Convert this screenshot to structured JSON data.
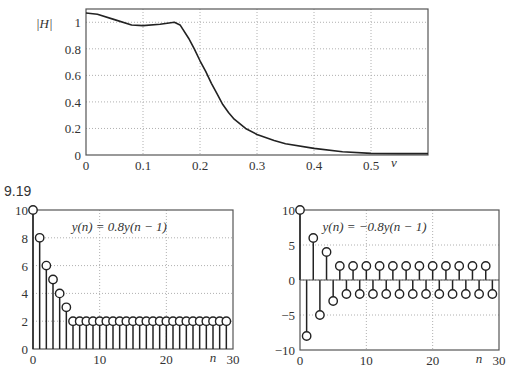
{
  "figure_label": "9.19",
  "chart_data": [
    {
      "type": "line",
      "title": "",
      "xlabel": "v",
      "ylabel": "|H|",
      "xlim": [
        0,
        0.6
      ],
      "ylim": [
        0,
        1.1
      ],
      "grid": true,
      "xticks": [
        0,
        0.1,
        0.2,
        0.3,
        0.4,
        0.5
      ],
      "xtick_labels": [
        "0",
        "0.1",
        "0.2",
        "0.3",
        "0.4",
        "0.5"
      ],
      "yticks": [
        0,
        0.2,
        0.4,
        0.6,
        0.8,
        1
      ],
      "ytick_labels": [
        "0",
        "0.2",
        "0.4",
        "0.6",
        "0.8",
        "1"
      ],
      "x": [
        0,
        0.02,
        0.05,
        0.08,
        0.1,
        0.13,
        0.155,
        0.165,
        0.18,
        0.19,
        0.2,
        0.21,
        0.22,
        0.23,
        0.24,
        0.25,
        0.26,
        0.28,
        0.3,
        0.33,
        0.35,
        0.4,
        0.45,
        0.5,
        0.55,
        0.6
      ],
      "y": [
        1.07,
        1.06,
        1.02,
        0.98,
        0.975,
        0.985,
        1.0,
        0.98,
        0.88,
        0.8,
        0.71,
        0.63,
        0.54,
        0.46,
        0.38,
        0.32,
        0.27,
        0.2,
        0.155,
        0.11,
        0.085,
        0.05,
        0.025,
        0.012,
        0.01,
        0.01
      ]
    },
    {
      "type": "stem",
      "title": "",
      "annotation": "y(n) = 0.8y(n − 1)",
      "xlabel": "n",
      "ylabel": "",
      "xlim": [
        0,
        30
      ],
      "ylim": [
        0,
        10
      ],
      "grid": true,
      "xticks": [
        0,
        10,
        20,
        30
      ],
      "xtick_labels": [
        "0",
        "10",
        "20",
        "30"
      ],
      "yticks": [
        0,
        2,
        4,
        6,
        8,
        10
      ],
      "ytick_labels": [
        "0",
        "2",
        "4",
        "6",
        "8",
        "10"
      ],
      "x": [
        0,
        1,
        2,
        3,
        4,
        5,
        6,
        7,
        8,
        9,
        10,
        11,
        12,
        13,
        14,
        15,
        16,
        17,
        18,
        19,
        20,
        21,
        22,
        23,
        24,
        25,
        26,
        27,
        28,
        29
      ],
      "y": [
        10,
        8,
        6,
        5,
        4,
        3,
        2,
        2,
        2,
        2,
        2,
        2,
        2,
        2,
        2,
        2,
        2,
        2,
        2,
        2,
        2,
        2,
        2,
        2,
        2,
        2,
        2,
        2,
        2,
        2
      ]
    },
    {
      "type": "stem",
      "title": "",
      "annotation": "y(n) = −0.8y(n − 1)",
      "xlabel": "n",
      "ylabel": "",
      "xlim": [
        0,
        30
      ],
      "ylim": [
        -10,
        10
      ],
      "grid": true,
      "xticks": [
        0,
        10,
        20,
        30
      ],
      "xtick_labels": [
        "0",
        "10",
        "20",
        "30"
      ],
      "yticks": [
        -10,
        -5,
        0,
        5,
        10
      ],
      "ytick_labels": [
        "−10",
        "−5",
        "0",
        "5",
        "10"
      ],
      "x": [
        0,
        1,
        2,
        3,
        4,
        5,
        6,
        7,
        8,
        9,
        10,
        11,
        12,
        13,
        14,
        15,
        16,
        17,
        18,
        19,
        20,
        21,
        22,
        23,
        24,
        25,
        26,
        27,
        28,
        29
      ],
      "y": [
        10,
        -8,
        6,
        -5,
        4,
        -3,
        2,
        -2,
        2,
        -2,
        2,
        -2,
        2,
        -2,
        2,
        -2,
        2,
        -2,
        2,
        -2,
        2,
        -2,
        2,
        -2,
        2,
        -2,
        2,
        -2,
        2,
        -2
      ]
    }
  ],
  "colors": {
    "line": "#222222",
    "axis": "#555555",
    "grid": "#b0b0b0"
  },
  "layout": {
    "plots": [
      {
        "left": 86,
        "top": 9,
        "right": 428,
        "bottom": 155
      },
      {
        "left": 33,
        "top": 210,
        "right": 233,
        "bottom": 349
      },
      {
        "left": 300,
        "top": 210,
        "right": 499,
        "bottom": 350
      }
    ]
  }
}
